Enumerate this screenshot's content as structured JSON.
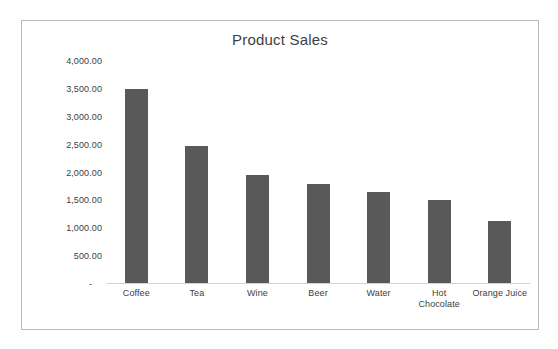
{
  "chart_data": {
    "type": "bar",
    "title": "Product Sales",
    "xlabel": "",
    "ylabel": "",
    "categories": [
      "Coffee",
      "Tea",
      "Wine",
      "Beer",
      "Water",
      "Hot Chocolate",
      "Orange Juice"
    ],
    "values": [
      3500.0,
      2460.0,
      1950.0,
      1780.0,
      1640.0,
      1500.0,
      1110.0
    ],
    "ylim": [
      0,
      4000
    ],
    "ytick_values": [
      4000,
      3500,
      3000,
      2500,
      2000,
      1500,
      1000,
      500,
      0
    ],
    "ytick_labels": [
      "4,000.00",
      "3,500.00",
      "3,000.00",
      "2,500.00",
      "2,000.00",
      "1,500.00",
      "1,000.00",
      "500.00",
      "-"
    ],
    "grid": false,
    "legend": false,
    "series": [
      {
        "name": "Product Sales",
        "values": [
          3500.0,
          2460.0,
          1950.0,
          1780.0,
          1640.0,
          1500.0,
          1110.0
        ]
      }
    ],
    "colors": {
      "bar": "#595959",
      "axis": "#d3d3d3",
      "border": "#b9b9b9",
      "title_text": "#3f3f3f",
      "tick_text": "#404040",
      "background": "#ffffff"
    }
  },
  "category_label_lines": [
    [
      "Coffee"
    ],
    [
      "Tea"
    ],
    [
      "Wine"
    ],
    [
      "Beer"
    ],
    [
      "Water"
    ],
    [
      "Hot",
      "Chocolate"
    ],
    [
      "Orange Juice"
    ]
  ]
}
